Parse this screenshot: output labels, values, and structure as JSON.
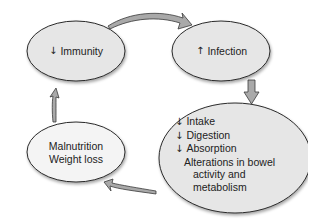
{
  "diagram": {
    "type": "cycle",
    "colors": {
      "node_fill": "#e6e6e6",
      "node_stroke": "#2a2a2a",
      "arrow_fill": "#a9a9a9",
      "arrow_stroke": "#3a3a3a",
      "text": "#222222",
      "background": "#ffffff"
    },
    "nodes": [
      {
        "id": "immunity",
        "direction_icon": "↓",
        "direction": "decrease",
        "label": "Immunity"
      },
      {
        "id": "infection",
        "direction_icon": "↑",
        "direction": "increase",
        "label": "Infection"
      },
      {
        "id": "gi-effects",
        "items": [
          {
            "direction_icon": "↓",
            "direction": "decrease",
            "label": "Intake"
          },
          {
            "direction_icon": "↓",
            "direction": "decrease",
            "label": "Digestion"
          },
          {
            "direction_icon": "↓",
            "direction": "decrease",
            "label": "Absorption"
          },
          {
            "direction_icon": "",
            "direction": "",
            "label": "Alterations in bowel"
          },
          {
            "direction_icon": "",
            "direction": "",
            "label": "activity and"
          },
          {
            "direction_icon": "",
            "direction": "",
            "label": "metabolism"
          }
        ]
      },
      {
        "id": "malnutrition",
        "lines": [
          "Malnutrition",
          "Weight loss"
        ]
      }
    ],
    "edges": [
      {
        "from": "immunity",
        "to": "infection"
      },
      {
        "from": "infection",
        "to": "gi-effects"
      },
      {
        "from": "gi-effects",
        "to": "malnutrition"
      },
      {
        "from": "malnutrition",
        "to": "immunity"
      }
    ]
  }
}
